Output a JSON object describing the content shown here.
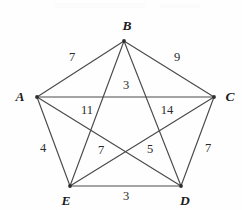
{
  "figure": {
    "type": "weighted-complete-graph",
    "name": "pentagon-with-diagonals",
    "width": 242,
    "height": 210,
    "background_color": "#fefefe",
    "line_color": "#4a4a4a"
  },
  "vertices": [
    {
      "id": "A",
      "label": "A",
      "x": 37,
      "y": 97,
      "label_x": 20,
      "label_y": 97
    },
    {
      "id": "B",
      "label": "B",
      "x": 124,
      "y": 41,
      "label_x": 127,
      "label_y": 26
    },
    {
      "id": "C",
      "label": "C",
      "x": 214,
      "y": 97,
      "label_x": 230,
      "label_y": 97
    },
    {
      "id": "D",
      "label": "D",
      "x": 181,
      "y": 186,
      "label_x": 185,
      "label_y": 201
    },
    {
      "id": "E",
      "label": "E",
      "x": 70,
      "y": 186,
      "label_x": 66,
      "label_y": 201
    }
  ],
  "edges": [
    {
      "from": "A",
      "to": "B",
      "weight": "7",
      "kind": "side",
      "label_x": 72,
      "label_y": 57
    },
    {
      "from": "B",
      "to": "C",
      "weight": "9",
      "kind": "side",
      "label_x": 177,
      "label_y": 57
    },
    {
      "from": "C",
      "to": "D",
      "weight": "7",
      "kind": "side",
      "label_x": 208,
      "label_y": 148
    },
    {
      "from": "D",
      "to": "E",
      "weight": "3",
      "kind": "side",
      "label_x": 126,
      "label_y": 196
    },
    {
      "from": "E",
      "to": "A",
      "weight": "4",
      "kind": "side",
      "label_x": 43,
      "label_y": 148
    },
    {
      "from": "A",
      "to": "C",
      "weight": "3",
      "kind": "diagonal",
      "label_x": 126,
      "label_y": 85
    },
    {
      "from": "B",
      "to": "E",
      "weight": "11",
      "kind": "diagonal",
      "label_x": 87,
      "label_y": 110
    },
    {
      "from": "B",
      "to": "D",
      "weight": "14",
      "kind": "diagonal",
      "label_x": 167,
      "label_y": 110
    },
    {
      "from": "A",
      "to": "D",
      "weight": "7",
      "kind": "diagonal",
      "label_x": 101,
      "label_y": 150
    },
    {
      "from": "C",
      "to": "E",
      "weight": "5",
      "kind": "diagonal",
      "label_x": 150,
      "label_y": 149
    }
  ]
}
